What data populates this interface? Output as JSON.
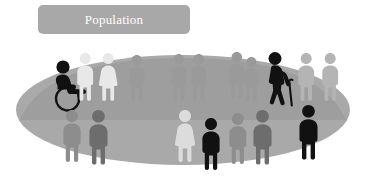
{
  "banner": {
    "label": "Population",
    "fill": "#a8a8a8",
    "text_color": "#ffffff"
  },
  "scene": {
    "background": "#ffffff",
    "ground_ellipse": {
      "name": "population-ground-ellipse",
      "cx": 183,
      "cy": 110,
      "rx": 167,
      "ry": 55,
      "fill": "#a9a9a9"
    },
    "crowd_blob": {
      "name": "background-crowd-mass",
      "fill": "#9c9c9c"
    },
    "palette": {
      "black": "#111111",
      "dark_grey": "#3d3d3d",
      "mid_grey": "#717171",
      "grey": "#8d8d8d",
      "light_grey": "#b9b9b9",
      "pale": "#d7d7d7",
      "white_figure": "#e8e8e8"
    },
    "figures": [
      {
        "id": 1,
        "name": "wheelchair-user-figure",
        "type": "wheelchair",
        "x": 52,
        "y": 60,
        "scale": 1.0,
        "color": "#111111",
        "row": "front-left",
        "highlight": true
      },
      {
        "id": 2,
        "name": "elderly-cane-figure",
        "type": "cane",
        "x": 263,
        "y": 52,
        "scale": 1.0,
        "color": "#111111",
        "row": "back-right",
        "highlight": true
      },
      {
        "id": 3,
        "name": "back-figure-male-1",
        "type": "male",
        "x": 76,
        "y": 53,
        "scale": 0.92,
        "color": "#e8e8e8",
        "row": "back"
      },
      {
        "id": 4,
        "name": "back-figure-female-1",
        "type": "female",
        "x": 99,
        "y": 53,
        "scale": 0.92,
        "color": "#e8e8e8",
        "row": "back"
      },
      {
        "id": 5,
        "name": "back-figure-male-2",
        "type": "male",
        "x": 128,
        "y": 55,
        "scale": 0.88,
        "color": "#9a9a9a",
        "row": "back"
      },
      {
        "id": 6,
        "name": "back-figure-male-3",
        "type": "male",
        "x": 170,
        "y": 54,
        "scale": 0.88,
        "color": "#9a9a9a",
        "row": "back"
      },
      {
        "id": 7,
        "name": "back-figure-male-4",
        "type": "male",
        "x": 190,
        "y": 54,
        "scale": 0.88,
        "color": "#9a9a9a",
        "row": "back"
      },
      {
        "id": 8,
        "name": "back-figure-male-5",
        "type": "male",
        "x": 228,
        "y": 52,
        "scale": 0.88,
        "color": "#9a9a9a",
        "row": "back"
      },
      {
        "id": 9,
        "name": "back-figure-male-6",
        "type": "male",
        "x": 243,
        "y": 57,
        "scale": 0.84,
        "color": "#9a9a9a",
        "row": "back"
      },
      {
        "id": 10,
        "name": "back-figure-male-7",
        "type": "male",
        "x": 297,
        "y": 53,
        "scale": 0.92,
        "color": "#b4b4b4",
        "row": "back"
      },
      {
        "id": 11,
        "name": "back-figure-male-8",
        "type": "male",
        "x": 321,
        "y": 53,
        "scale": 0.92,
        "color": "#b4b4b4",
        "row": "back"
      },
      {
        "id": 12,
        "name": "front-figure-male-1",
        "type": "male",
        "x": 62,
        "y": 110,
        "scale": 1.0,
        "color": "#8d8d8d",
        "row": "front"
      },
      {
        "id": 13,
        "name": "front-figure-male-2",
        "type": "male",
        "x": 88,
        "y": 110,
        "scale": 1.05,
        "color": "#6d6d6d",
        "row": "front"
      },
      {
        "id": 14,
        "name": "front-figure-female-2",
        "type": "female",
        "x": 175,
        "y": 110,
        "scale": 1.0,
        "color": "#dcdcdc",
        "row": "front"
      },
      {
        "id": 15,
        "name": "front-figure-male-3",
        "type": "male",
        "x": 201,
        "y": 118,
        "scale": 1.0,
        "color": "#111111",
        "row": "front",
        "highlight": true
      },
      {
        "id": 16,
        "name": "front-figure-male-4",
        "type": "male",
        "x": 228,
        "y": 113,
        "scale": 0.98,
        "color": "#8d8d8d",
        "row": "front"
      },
      {
        "id": 17,
        "name": "front-figure-male-5",
        "type": "male",
        "x": 252,
        "y": 110,
        "scale": 1.05,
        "color": "#6d6d6d",
        "row": "front"
      },
      {
        "id": 18,
        "name": "front-figure-male-6",
        "type": "male",
        "x": 298,
        "y": 105,
        "scale": 1.05,
        "color": "#111111",
        "row": "front",
        "highlight": true
      }
    ]
  }
}
